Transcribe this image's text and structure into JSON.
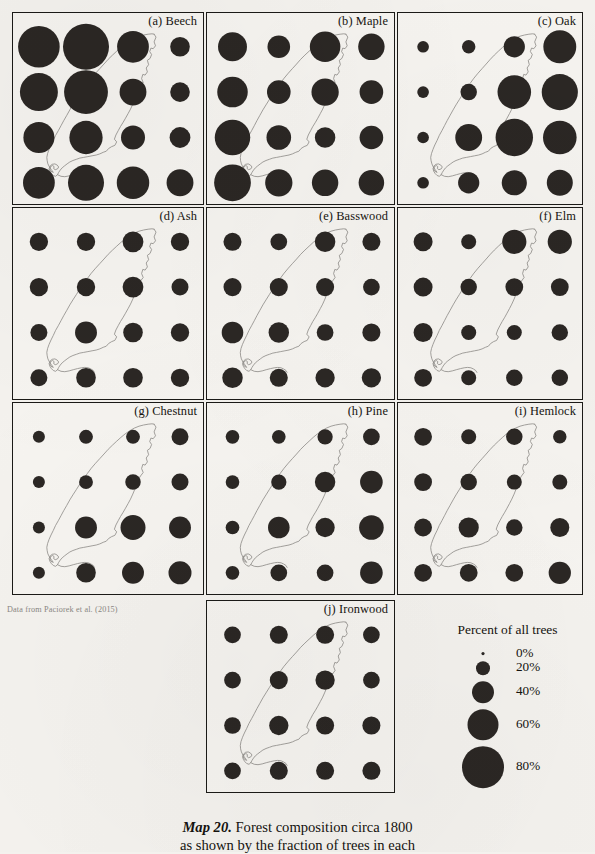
{
  "figure": {
    "caption_label": "Map 20.",
    "caption_title": " Forest composition circa 1800",
    "caption_line2": "as shown by the fraction of trees in each",
    "source_note": "Data from Paciorek et al. (2015)"
  },
  "legend": {
    "title": "Percent of all trees",
    "items": [
      {
        "label": "0%",
        "value": 0,
        "radius": 1.6
      },
      {
        "label": "20%",
        "value": 20,
        "radius": 7.0
      },
      {
        "label": "40%",
        "value": 40,
        "radius": 11.0
      },
      {
        "label": "60%",
        "value": 60,
        "radius": 15.5
      },
      {
        "label": "80%",
        "value": 80,
        "radius": 21.0
      }
    ]
  },
  "chart_data": {
    "type": "scatter",
    "title": "Forest composition circa 1800",
    "subtitle": "Percent of all trees, by species, on a 4×4 sample grid",
    "xlabel": "",
    "ylabel": "",
    "grid": false,
    "legend_position": "bottom-right",
    "encoding": "bubble area proportional to percent of all trees",
    "value_units": "percent",
    "grid_columns": 4,
    "grid_rows": 4,
    "panels": [
      {
        "key": "a",
        "label": "(a) Beech",
        "species": "Beech",
        "values": [
          [
            72,
            88,
            42,
            16
          ],
          [
            60,
            80,
            30,
            16
          ],
          [
            40,
            46,
            24,
            18
          ],
          [
            42,
            54,
            44,
            30
          ]
        ]
      },
      {
        "key": "b",
        "label": "(b) Maple",
        "species": "Maple",
        "values": [
          [
            36,
            22,
            40,
            30
          ],
          [
            40,
            24,
            32,
            24
          ],
          [
            54,
            26,
            18,
            24
          ],
          [
            58,
            32,
            30,
            28
          ]
        ]
      },
      {
        "key": "c",
        "label": "(c) Oak",
        "species": "Oak",
        "values": [
          [
            6,
            8,
            20,
            48
          ],
          [
            6,
            12,
            50,
            58
          ],
          [
            6,
            32,
            62,
            50
          ],
          [
            6,
            20,
            28,
            30
          ]
        ]
      },
      {
        "key": "d",
        "label": "(d) Ash",
        "species": "Ash",
        "values": [
          [
            14,
            14,
            18,
            14
          ],
          [
            14,
            14,
            18,
            12
          ],
          [
            12,
            20,
            16,
            14
          ],
          [
            12,
            16,
            16,
            14
          ]
        ]
      },
      {
        "key": "e",
        "label": "(e) Basswood",
        "species": "Basswood",
        "values": [
          [
            14,
            12,
            18,
            14
          ],
          [
            14,
            14,
            14,
            12
          ],
          [
            20,
            18,
            12,
            14
          ],
          [
            18,
            14,
            16,
            16
          ]
        ]
      },
      {
        "key": "f",
        "label": "(f) Elm",
        "species": "Elm",
        "values": [
          [
            16,
            10,
            26,
            26
          ],
          [
            16,
            12,
            14,
            14
          ],
          [
            16,
            10,
            10,
            12
          ],
          [
            14,
            10,
            12,
            12
          ]
        ]
      },
      {
        "key": "g",
        "label": "(g) Chestnut",
        "species": "Chestnut",
        "values": [
          [
            6,
            8,
            8,
            12
          ],
          [
            6,
            8,
            10,
            12
          ],
          [
            6,
            20,
            26,
            20
          ],
          [
            6,
            16,
            20,
            22
          ]
        ]
      },
      {
        "key": "h",
        "label": "(h) Pine",
        "species": "Pine",
        "values": [
          [
            8,
            8,
            10,
            12
          ],
          [
            8,
            10,
            18,
            22
          ],
          [
            8,
            20,
            16,
            26
          ],
          [
            8,
            12,
            12,
            22
          ]
        ]
      },
      {
        "key": "i",
        "label": "(i) Hemlock",
        "species": "Hemlock",
        "values": [
          [
            14,
            10,
            12,
            8
          ],
          [
            14,
            12,
            10,
            10
          ],
          [
            14,
            18,
            12,
            16
          ],
          [
            14,
            14,
            14,
            22
          ]
        ]
      },
      {
        "key": "j",
        "label": "(j) Ironwood",
        "species": "Ironwood",
        "values": [
          [
            12,
            14,
            14,
            12
          ],
          [
            12,
            14,
            16,
            12
          ],
          [
            12,
            16,
            14,
            14
          ],
          [
            12,
            14,
            14,
            14
          ]
        ]
      }
    ]
  }
}
